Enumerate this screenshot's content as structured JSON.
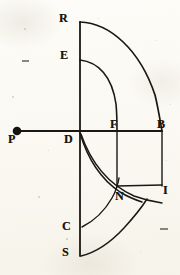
{
  "figure": {
    "background_color": "#fdfcf8",
    "ink_color": "#1a1813",
    "labels": [
      {
        "id": "R",
        "text": "R",
        "x": 59,
        "y": 12,
        "point_x": 80,
        "point_y": 22
      },
      {
        "id": "E",
        "text": "E",
        "x": 60,
        "y": 49,
        "point_x": 80,
        "point_y": 60
      },
      {
        "id": "P",
        "text": "P",
        "x": 9,
        "y": 133,
        "point_x": 17,
        "point_y": 131
      },
      {
        "id": "D",
        "text": "D",
        "x": 64,
        "y": 133,
        "point_x": 80,
        "point_y": 131
      },
      {
        "id": "F",
        "text": "F",
        "x": 110,
        "y": 119,
        "point_x": 117,
        "point_y": 131
      },
      {
        "id": "B",
        "text": "B",
        "x": 157,
        "y": 119,
        "point_x": 162,
        "point_y": 131
      },
      {
        "id": "I",
        "text": "I",
        "x": 162,
        "y": 184,
        "point_x": 162,
        "point_y": 185
      },
      {
        "id": "N",
        "text": "N",
        "x": 115,
        "y": 190,
        "point_x": 117,
        "point_y": 186
      },
      {
        "id": "C",
        "text": "C",
        "x": 62,
        "y": 220,
        "point_x": 80,
        "point_y": 226
      },
      {
        "id": "S",
        "text": "S",
        "x": 62,
        "y": 246,
        "point_x": 80,
        "point_y": 256
      }
    ],
    "points": [
      {
        "id": "P",
        "x": 17,
        "y": 131,
        "marker": "filled-dot",
        "radius": 4.2
      }
    ],
    "lines": [
      {
        "id": "PB",
        "from": "P",
        "to": "B",
        "x1": 17,
        "y1": 131,
        "x2": 162,
        "y2": 131,
        "width": 1.7
      },
      {
        "id": "RS",
        "from": "R",
        "to": "S",
        "x1": 80,
        "y1": 22,
        "x2": 80,
        "y2": 256,
        "width": 1.7
      },
      {
        "id": "FN",
        "from": "F",
        "to": "N",
        "x1": 117,
        "y1": 131,
        "x2": 117,
        "y2": 186,
        "width": 1.4
      },
      {
        "id": "BI",
        "from": "B",
        "to": "I",
        "x1": 162,
        "y1": 131,
        "x2": 162,
        "y2": 185,
        "width": 1.4
      },
      {
        "id": "NI",
        "from": "N",
        "to": "I",
        "x1": 117,
        "y1": 186,
        "x2": 162,
        "y2": 185,
        "width": 1.4
      }
    ],
    "arcs": [
      {
        "id": "RB",
        "from": "R",
        "to": "B",
        "center": "D",
        "radius": 109,
        "description": "outer quadrant arc from R to B"
      },
      {
        "id": "EF",
        "from": "E",
        "to": "F",
        "center": "D",
        "radius": 71,
        "description": "inner quadrant arc from E to F"
      },
      {
        "id": "DN",
        "from": "D",
        "to": "N",
        "center": "B",
        "radius": 83,
        "description": "lower arc from D through to N"
      },
      {
        "id": "DI",
        "from": "D",
        "to": "I",
        "center": "F",
        "radius": 95,
        "description": "lower arc from D through C region to I"
      },
      {
        "id": "CS",
        "from": "C",
        "to": "S",
        "center": "D",
        "radius": 95,
        "description": "short arc near C and S at lower vertical"
      }
    ],
    "specks": [
      {
        "x": 24,
        "y": 28,
        "size": 1.6
      },
      {
        "x": 155,
        "y": 40,
        "size": 1.4
      },
      {
        "x": 12,
        "y": 96,
        "size": 1.8
      },
      {
        "x": 170,
        "y": 104,
        "size": 1.3
      },
      {
        "x": 38,
        "y": 196,
        "size": 1.5
      },
      {
        "x": 140,
        "y": 252,
        "size": 1.4
      },
      {
        "x": 66,
        "y": 238,
        "size": 1.5
      },
      {
        "x": 98,
        "y": 18,
        "size": 1.2
      },
      {
        "x": 48,
        "y": 150,
        "size": 1.3
      },
      {
        "x": 166,
        "y": 160,
        "size": 1.2
      }
    ],
    "dash_marks": [
      {
        "x": 22,
        "y": 60,
        "width": 7
      },
      {
        "x": 160,
        "y": 228,
        "width": 8
      }
    ]
  }
}
